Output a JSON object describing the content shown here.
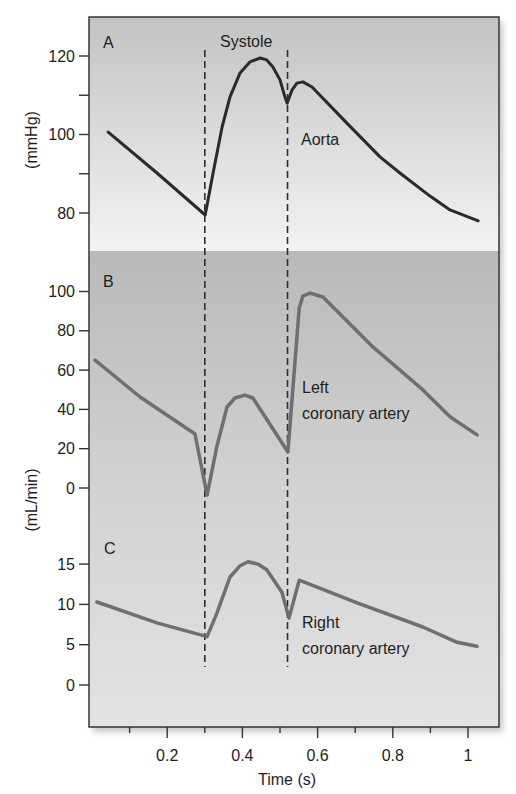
{
  "chart_data": {
    "type": "line",
    "title": "",
    "xlabel": "Time (s)",
    "xlim": [
      0,
      1.09
    ],
    "xticks": [
      0.2,
      0.4,
      0.6,
      0.8,
      1
    ],
    "xtick_labels": [
      "0.2",
      "0.4",
      "0.6",
      "0.8",
      "1"
    ],
    "xminor_ticks": [
      0.1,
      0.3,
      0.5,
      0.7,
      0.9
    ],
    "grid": false,
    "legend": "none (inline curve labels)",
    "annotations": {
      "systole_label": "Systole",
      "systole_bounds": [
        0.3,
        0.52
      ]
    },
    "shared_ylabel_bc": "(mL/min)",
    "panels": [
      {
        "label": "A",
        "ylabel": "(mmHg)",
        "ylim": [
          70,
          125
        ],
        "yticks": [
          80,
          100,
          120
        ],
        "ytick_labels": [
          "80",
          "100",
          "120"
        ],
        "yminor_ticks": [
          90,
          110
        ],
        "series": [
          {
            "id": "aorta",
            "name": "Aorta",
            "label_lines": [
              "Aorta"
            ],
            "x": [
              0.043,
              0.173,
              0.301,
              0.322,
              0.346,
              0.367,
              0.394,
              0.42,
              0.447,
              0.465,
              0.481,
              0.5,
              0.513,
              0.519,
              0.532,
              0.545,
              0.561,
              0.585,
              0.678,
              0.766,
              0.819,
              0.899,
              0.952,
              1.027
            ],
            "y": [
              100.6,
              90.2,
              79.5,
              90.2,
              101.9,
              109.6,
              115.7,
              118.5,
              119.5,
              119.0,
              117.2,
              113.9,
              109.6,
              108.0,
              111.3,
              113.1,
              113.4,
              112.1,
              102.9,
              94.3,
              90.2,
              84.3,
              80.8,
              78.0
            ]
          }
        ]
      },
      {
        "label": "B",
        "ylabel": "(mL/min)",
        "ylim": [
          -5,
          110
        ],
        "yticks": [
          0,
          20,
          40,
          60,
          80,
          100
        ],
        "ytick_labels": [
          "0",
          "20",
          "40",
          "60",
          "80",
          "100"
        ],
        "series": [
          {
            "id": "left-coronary-artery",
            "name": "Left coronary artery",
            "label_lines": [
              "Left",
              "coronary artery"
            ],
            "x": [
              0.008,
              0.128,
              0.274,
              0.306,
              0.332,
              0.359,
              0.38,
              0.407,
              0.428,
              0.521,
              0.551,
              0.561,
              0.58,
              0.614,
              0.747,
              0.88,
              0.952,
              1.024
            ],
            "y": [
              65.1,
              46.3,
              27.5,
              -3.6,
              21.0,
              41.2,
              45.8,
              47.3,
              45.8,
              18.3,
              91.6,
              97.7,
              99.2,
              97.2,
              71.8,
              49.9,
              36.3,
              27.0
            ]
          }
        ]
      },
      {
        "label": "C",
        "ylabel": "(mL/min)",
        "ylim": [
          -3,
          18
        ],
        "yticks": [
          0,
          5,
          10,
          15
        ],
        "ytick_labels": [
          "0",
          "5",
          "10",
          "15"
        ],
        "series": [
          {
            "id": "right-coronary-artery",
            "name": "Right coronary artery",
            "label_lines": [
              "Right",
              "coronary artery"
            ],
            "x": [
              0.013,
              0.173,
              0.306,
              0.332,
              0.367,
              0.394,
              0.415,
              0.441,
              0.465,
              0.505,
              0.524,
              0.551,
              0.705,
              0.88,
              0.971,
              1.024
            ],
            "y": [
              10.3,
              7.7,
              6.0,
              8.9,
              13.4,
              14.8,
              15.3,
              15.0,
              14.3,
              11.5,
              8.3,
              13.0,
              10.2,
              7.2,
              5.3,
              4.8
            ]
          }
        ]
      }
    ]
  },
  "colors": {
    "aorta_curve": "#2a2a2a",
    "coronary_curves": "#6f6f6f",
    "panel_a_bg_top": "#c3c3c3",
    "panel_a_bg_bottom": "#f3f3f3",
    "panel_bc_bg_top": "#b9b9b9",
    "panel_bc_bg_bottom": "#e3e3e3"
  }
}
